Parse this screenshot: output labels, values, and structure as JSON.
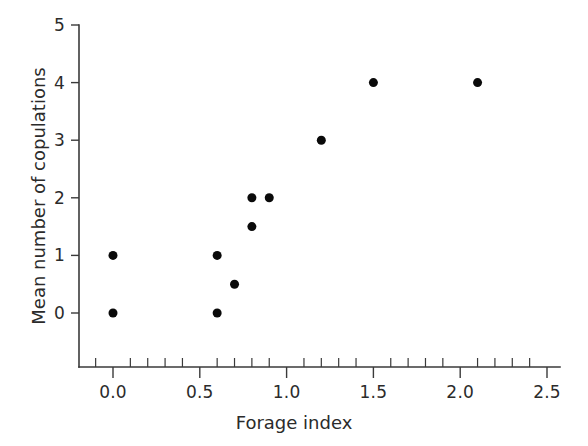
{
  "chart_data": {
    "type": "scatter",
    "title": "",
    "xlabel": "Forage index",
    "ylabel": "Mean number of copulations",
    "xlim": [
      -0.2,
      2.5
    ],
    "ylim": [
      -0.9,
      5
    ],
    "grid": false,
    "legend": "none",
    "marker": {
      "shape": "circle",
      "color": "#0a0a0a",
      "size_px": 9
    },
    "x_ticks_major": [
      0.0,
      0.5,
      1.0,
      1.5,
      2.0,
      2.5
    ],
    "x_tick_labels": [
      "0.0",
      "0.5",
      "1.0",
      "1.5",
      "2.0",
      "2.5"
    ],
    "x_tick_minor_step": 0.1,
    "y_ticks_major": [
      0,
      1,
      2,
      3,
      4,
      5
    ],
    "y_tick_labels": [
      "0",
      "1",
      "2",
      "3",
      "4",
      "5"
    ],
    "points": [
      {
        "x": 0.0,
        "y": 1.0
      },
      {
        "x": 0.0,
        "y": 0.0
      },
      {
        "x": 0.6,
        "y": 1.0
      },
      {
        "x": 0.6,
        "y": 0.0
      },
      {
        "x": 0.7,
        "y": 0.5
      },
      {
        "x": 0.8,
        "y": 2.0
      },
      {
        "x": 0.8,
        "y": 1.5
      },
      {
        "x": 0.9,
        "y": 2.0
      },
      {
        "x": 1.2,
        "y": 3.0
      },
      {
        "x": 1.5,
        "y": 4.0
      },
      {
        "x": 2.1,
        "y": 4.0
      }
    ],
    "x": [
      0.0,
      0.0,
      0.6,
      0.6,
      0.7,
      0.8,
      0.8,
      0.9,
      1.2,
      1.5,
      2.1
    ],
    "values": [
      1.0,
      0.0,
      1.0,
      0.0,
      0.5,
      2.0,
      1.5,
      2.0,
      3.0,
      4.0,
      4.0
    ],
    "colors": {
      "axis": "#3a3a3a",
      "text": "#2b2b2b",
      "marker": "#0a0a0a",
      "background": "#ffffff"
    }
  }
}
